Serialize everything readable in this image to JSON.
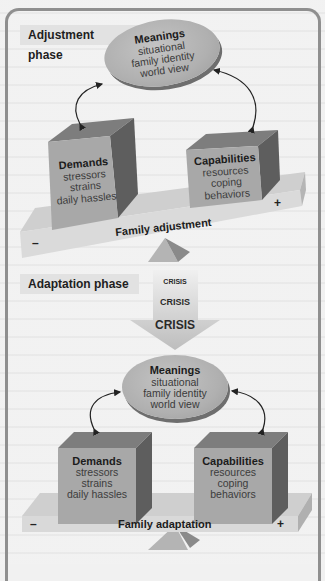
{
  "adjustment": {
    "phase_label": "Adjustment phase",
    "meanings": {
      "title": "Meanings",
      "lines": [
        "situational",
        "family identity",
        "world view"
      ]
    },
    "demands": {
      "title": "Demands",
      "lines": [
        "stressors",
        "strains",
        "daily hassles"
      ]
    },
    "capabilities": {
      "title": "Capabilities",
      "lines": [
        "resources",
        "coping behaviors"
      ]
    },
    "beam_label": "Family adjustment",
    "minus": "–",
    "plus": "+"
  },
  "adaptation": {
    "phase_label": "Adaptation phase",
    "crisis": [
      "CRISIS",
      "CRISIS",
      "CRISIS"
    ],
    "meanings": {
      "title": "Meanings",
      "lines": [
        "situational",
        "family identity",
        "world view"
      ]
    },
    "demands": {
      "title": "Demands",
      "lines": [
        "stressors",
        "strains",
        "daily hassles"
      ]
    },
    "capabilities": {
      "title": "Capabilities",
      "lines": [
        "resources",
        "coping",
        "behaviors"
      ]
    },
    "beam_label": "Family adaptation",
    "minus": "–",
    "plus": "+"
  },
  "colors": {
    "frame": "#8f8f8f",
    "label_bg": "#e2e2e2",
    "box_front": "#a9a9a9",
    "box_top": "#7d7d7d",
    "box_side": "#606060",
    "ellipse": "#b5b5b5",
    "beam": "#d6d6d6"
  }
}
